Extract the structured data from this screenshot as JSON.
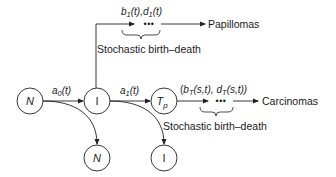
{
  "diagram": {
    "colors": {
      "stroke": "#222222",
      "text": "#1a1a1a",
      "background": "#ffffff"
    },
    "nodes": {
      "normal_main": {
        "label": "N",
        "sub": ""
      },
      "initiated_main": {
        "label": "I",
        "sub": ""
      },
      "tp": {
        "label": "T",
        "sub": "p"
      },
      "normal_bottom": {
        "label": "N",
        "sub": ""
      },
      "initiated_bottom": {
        "label": "I",
        "sub": ""
      }
    },
    "rates": {
      "a0": {
        "base": "a",
        "sub": "0",
        "arg": "(t)"
      },
      "a1": {
        "base": "a",
        "sub": "1",
        "arg": "(t)"
      },
      "papilloma_rates": {
        "b": "b",
        "b_sub": "1",
        "b_arg": "(t),",
        "d": "d",
        "d_sub": "1",
        "d_arg": "(t)"
      },
      "carcinoma_rates": {
        "open": "(",
        "b": "b",
        "b_sub": "T",
        "b_arg": "(s,t),",
        "d": "d",
        "d_sub": "T",
        "d_arg": "(s,t))"
      }
    },
    "ellipsis": "•••",
    "outcomes": {
      "papillomas": "Papillomas",
      "carcinomas": "Carcinomas"
    },
    "process_labels": {
      "upper": "Stochastic birth–death",
      "lower": "Stochastic birth–death"
    }
  }
}
